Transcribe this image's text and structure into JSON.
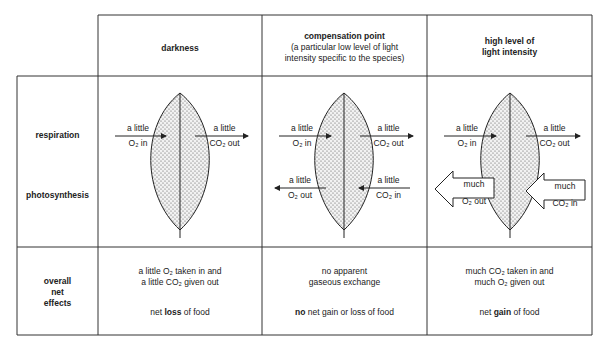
{
  "columns": [
    {
      "id": "darkness",
      "title": "darkness",
      "subtitle": ""
    },
    {
      "id": "compensation",
      "title": "compensation point",
      "subtitle_line1": "(a particular low level of light",
      "subtitle_line2": "intensity specific to the species)"
    },
    {
      "id": "high",
      "title_line1": "high level of",
      "title_line2": "light intensity"
    }
  ],
  "rows": {
    "respiration": "respiration",
    "photosynthesis": "photosynthesis",
    "overall_line1": "overall",
    "overall_line2": "net",
    "overall_line3": "effects"
  },
  "arrows": {
    "a_little": "a little",
    "o2_in": "O₂ in",
    "co2_out": "CO₂ out",
    "o2_out": "O₂ out",
    "co2_in": "CO₂ in",
    "much": "much"
  },
  "effects": {
    "darkness_line1": "a little O₂ taken in and",
    "darkness_line2": "a little CO₂ given out",
    "darkness_pre": "net ",
    "darkness_bold": "loss",
    "darkness_post": " of food",
    "comp_line1": "no apparent",
    "comp_line2": "gaseous exchange",
    "comp_bold": "no",
    "comp_post": " net gain or loss of food",
    "high_line1": "much CO₂ taken in and",
    "high_line2": "much O₂ given out",
    "high_pre": "net ",
    "high_bold": "gain",
    "high_post": " of food"
  }
}
